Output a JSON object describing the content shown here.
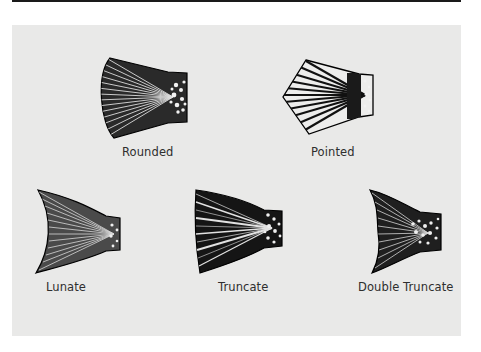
{
  "figure": {
    "colors": {
      "panel_background": "#e9e9e8",
      "ink": "#111111",
      "label_text": "#2e2e2e",
      "top_rule": "#1a1a1a"
    },
    "fins": [
      {
        "id": "rounded",
        "label": "Rounded"
      },
      {
        "id": "pointed",
        "label": "Pointed"
      },
      {
        "id": "lunate",
        "label": "Lunate"
      },
      {
        "id": "truncate",
        "label": "Truncate"
      },
      {
        "id": "double-truncate",
        "label": "Double Truncate"
      }
    ]
  }
}
